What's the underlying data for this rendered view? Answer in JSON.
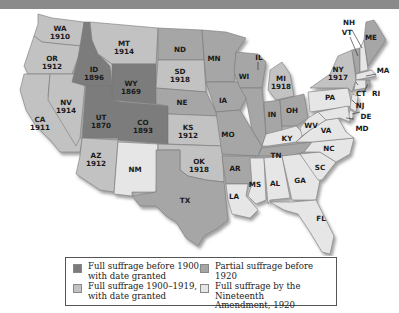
{
  "colors": {
    "before_1900": "#7b7b7b",
    "full_1900_1919": "#c2c2c2",
    "partial": "#a6a6a6",
    "nineteenth": "#e6e6e6",
    "header_bar": "#8a8a8a"
  },
  "legend": {
    "items": [
      {
        "key": "before_1900",
        "label_1": "Full suffrage before 1900,",
        "label_2": "with date granted"
      },
      {
        "key": "full_1900_1919",
        "label_1": "Full suffrage 1900–1919,",
        "label_2": "with date granted"
      },
      {
        "key": "partial",
        "label_1": "Partial suffrage before 1920",
        "label_2": ""
      },
      {
        "key": "nineteenth",
        "label_1": "Full suffrage by the Nineteenth",
        "label_2": "Amendment, 1920"
      }
    ]
  },
  "states": {
    "WA": {
      "abbr": "WA",
      "year": "1910",
      "category": "full_1900_1919"
    },
    "OR": {
      "abbr": "OR",
      "year": "1912",
      "category": "full_1900_1919"
    },
    "CA": {
      "abbr": "CA",
      "year": "1911",
      "category": "full_1900_1919"
    },
    "NV": {
      "abbr": "NV",
      "year": "1914",
      "category": "full_1900_1919"
    },
    "ID": {
      "abbr": "ID",
      "year": "1896",
      "category": "before_1900"
    },
    "MT": {
      "abbr": "MT",
      "year": "1914",
      "category": "full_1900_1919"
    },
    "WY": {
      "abbr": "WY",
      "year": "1869",
      "category": "before_1900"
    },
    "UT": {
      "abbr": "UT",
      "year": "1870",
      "category": "before_1900"
    },
    "CO": {
      "abbr": "CO",
      "year": "1893",
      "category": "before_1900"
    },
    "AZ": {
      "abbr": "AZ",
      "year": "1912",
      "category": "full_1900_1919"
    },
    "NM": {
      "abbr": "NM",
      "year": "",
      "category": "nineteenth"
    },
    "ND": {
      "abbr": "ND",
      "year": "",
      "category": "partial"
    },
    "SD": {
      "abbr": "SD",
      "year": "1918",
      "category": "full_1900_1919"
    },
    "NE": {
      "abbr": "NE",
      "year": "",
      "category": "partial"
    },
    "KS": {
      "abbr": "KS",
      "year": "1912",
      "category": "full_1900_1919"
    },
    "OK": {
      "abbr": "OK",
      "year": "1918",
      "category": "full_1900_1919"
    },
    "TX": {
      "abbr": "TX",
      "year": "",
      "category": "partial"
    },
    "MN": {
      "abbr": "MN",
      "year": "",
      "category": "partial"
    },
    "IA": {
      "abbr": "IA",
      "year": "",
      "category": "partial"
    },
    "MO": {
      "abbr": "MO",
      "year": "",
      "category": "partial"
    },
    "AR": {
      "abbr": "AR",
      "year": "",
      "category": "partial"
    },
    "LA": {
      "abbr": "LA",
      "year": "",
      "category": "nineteenth"
    },
    "WI": {
      "abbr": "WI",
      "year": "",
      "category": "partial"
    },
    "IL": {
      "abbr": "IL",
      "year": "",
      "category": "partial"
    },
    "MI": {
      "abbr": "MI",
      "year": "1918",
      "category": "full_1900_1919"
    },
    "IN": {
      "abbr": "IN",
      "year": "",
      "category": "partial"
    },
    "OH": {
      "abbr": "OH",
      "year": "",
      "category": "partial"
    },
    "KY": {
      "abbr": "KY",
      "year": "",
      "category": "nineteenth"
    },
    "TN": {
      "abbr": "TN",
      "year": "",
      "category": "partial"
    },
    "MS": {
      "abbr": "MS",
      "year": "",
      "category": "nineteenth"
    },
    "AL": {
      "abbr": "AL",
      "year": "",
      "category": "nineteenth"
    },
    "GA": {
      "abbr": "GA",
      "year": "",
      "category": "nineteenth"
    },
    "FL": {
      "abbr": "FL",
      "year": "",
      "category": "nineteenth"
    },
    "SC": {
      "abbr": "SC",
      "year": "",
      "category": "nineteenth"
    },
    "NC": {
      "abbr": "NC",
      "year": "",
      "category": "nineteenth"
    },
    "VA": {
      "abbr": "VA",
      "year": "",
      "category": "nineteenth"
    },
    "WV": {
      "abbr": "WV",
      "year": "",
      "category": "nineteenth"
    },
    "PA": {
      "abbr": "PA",
      "year": "",
      "category": "nineteenth"
    },
    "NY": {
      "abbr": "NY",
      "year": "1917",
      "category": "full_1900_1919"
    },
    "VT": {
      "abbr": "VT",
      "year": "",
      "category": "partial"
    },
    "NH": {
      "abbr": "NH",
      "year": "",
      "category": "nineteenth"
    },
    "ME": {
      "abbr": "ME",
      "year": "",
      "category": "partial"
    },
    "MA": {
      "abbr": "MA",
      "year": "",
      "category": "nineteenth"
    },
    "CT": {
      "abbr": "CT",
      "year": "",
      "category": "nineteenth"
    },
    "RI": {
      "abbr": "RI",
      "year": "",
      "category": "partial"
    },
    "NJ": {
      "abbr": "NJ",
      "year": "",
      "category": "nineteenth"
    },
    "DE": {
      "abbr": "DE",
      "year": "",
      "category": "nineteenth"
    },
    "MD": {
      "abbr": "MD",
      "year": "",
      "category": "nineteenth"
    }
  }
}
